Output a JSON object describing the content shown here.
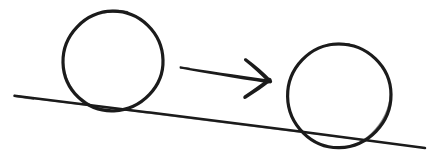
{
  "canvas": {
    "width": 436,
    "height": 163,
    "background_color": "#ffffff",
    "ink_color": "#1b1b1b",
    "title": "Ball rolling down an incline",
    "medium": "hand-drawn ink sketch",
    "visible_text": ""
  },
  "diagram": {
    "type": "physics-sketch",
    "element_count": 4,
    "elements": [
      {
        "id": "incline-line",
        "name": "incline-ground-line",
        "kind": "line",
        "label": "",
        "stroke_width": 2.4,
        "x1": 14,
        "y1": 96,
        "x2": 425,
        "y2": 148,
        "slope_description": "descends left to right",
        "slope_value": 0.127,
        "angle_degrees": 7.2
      },
      {
        "id": "ball-left",
        "name": "left-circle-ball",
        "kind": "circle",
        "label": "",
        "stroke_width": 3.1,
        "cx": 113,
        "cy": 61,
        "r": 50,
        "bbox": [
          63,
          11,
          163,
          111
        ],
        "contact_point": [
          113,
          110
        ]
      },
      {
        "id": "motion-arrow",
        "name": "motion-arrow",
        "kind": "arrow",
        "label": "",
        "direction": "right",
        "tail": [
          180,
          67
        ],
        "tip": [
          272,
          82
        ],
        "shaft_taper": "thin at tail, thick at head",
        "head_barb_upper": [
          247,
          59
        ],
        "head_barb_lower": [
          244,
          99
        ]
      },
      {
        "id": "ball-right",
        "name": "right-circle-ball",
        "kind": "circle",
        "label": "",
        "stroke_width": 3.1,
        "cx": 339,
        "cy": 96,
        "r": 52,
        "bbox": [
          287,
          44,
          391,
          148
        ],
        "contact_point": [
          339,
          147
        ]
      }
    ]
  }
}
